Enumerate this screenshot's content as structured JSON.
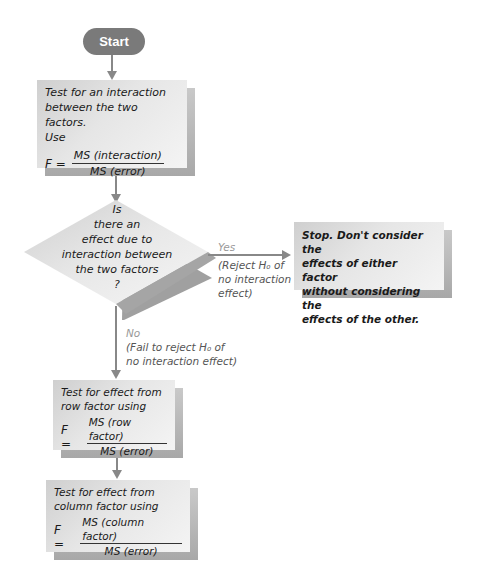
{
  "flowchart": {
    "start": {
      "label": "Start"
    },
    "interaction_test": {
      "text_lines": [
        "Test for an interaction",
        "between the two factors.",
        "Use"
      ],
      "formula": {
        "lhs": "F =",
        "numerator": "MS (interaction)",
        "denominator": "MS (error)"
      }
    },
    "decision": {
      "lines": [
        "Is",
        "there an",
        "effect due to",
        "interaction between",
        "the two factors",
        "?"
      ]
    },
    "yes_branch": {
      "label": "Yes",
      "note_lines": [
        "(Reject H₀ of",
        "no interaction",
        "effect)"
      ]
    },
    "stop_box": {
      "lines": [
        "Stop. Don't consider the",
        "effects of either factor",
        "without considering the",
        "effects of the other."
      ]
    },
    "no_branch": {
      "label": "No",
      "note_lines": [
        "(Fail to reject H₀ of",
        "no interaction effect)"
      ]
    },
    "row_test": {
      "text_lines": [
        "Test for effect from",
        "row factor using"
      ],
      "formula": {
        "lhs": "F =",
        "numerator": "MS (row factor)",
        "denominator": "MS (error)"
      }
    },
    "column_test": {
      "text_lines": [
        "Test for effect from",
        "column factor using"
      ],
      "formula": {
        "lhs": "F =",
        "numerator": "MS (column factor)",
        "denominator": "MS (error)"
      }
    }
  },
  "colors": {
    "start_fill": "#7a7a7a",
    "box_face": "#e6e6e6",
    "box_shadow": "#b0b0b0",
    "connector": "#888888"
  }
}
